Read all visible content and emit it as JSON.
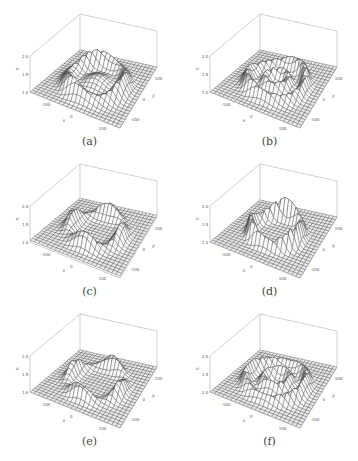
{
  "figure": {
    "panels": [
      {
        "id": "a",
        "caption": "(a)",
        "pattern": "ring-inner-dome",
        "col": 0,
        "row": 0
      },
      {
        "id": "b",
        "caption": "(b)",
        "pattern": "ring-double",
        "col": 1,
        "row": 0
      },
      {
        "id": "c",
        "caption": "(c)",
        "pattern": "ring-lumpy",
        "col": 0,
        "row": 1
      },
      {
        "id": "d",
        "caption": "(d)",
        "pattern": "ring-sharp",
        "col": 1,
        "row": 1
      },
      {
        "id": "e",
        "caption": "(e)",
        "pattern": "ring-lumpy-2",
        "col": 0,
        "row": 2
      },
      {
        "id": "f",
        "caption": "(f)",
        "pattern": "ring-double-2",
        "col": 1,
        "row": 2
      }
    ],
    "axes": {
      "z_label": "u",
      "z_ticks": [
        "1.0",
        "1.5",
        "2.0"
      ],
      "x_label": "x",
      "x_ticks": [
        "-100",
        "0",
        "100"
      ],
      "y_label": "y",
      "y_ticks": [
        "-100",
        "0",
        "100"
      ]
    }
  },
  "chart_data": [
    {
      "type": "surface",
      "title": "(a)",
      "xlabel": "x",
      "ylabel": "y",
      "zlabel": "u",
      "xlim": [
        -150,
        150
      ],
      "ylim": [
        -150,
        150
      ],
      "zlim": [
        1.0,
        2.0
      ],
      "description": "ring-shaped elevated region with central dome, uneven ring heights"
    },
    {
      "type": "surface",
      "title": "(b)",
      "xlabel": "x",
      "ylabel": "y",
      "zlabel": "u",
      "xlim": [
        -150,
        150
      ],
      "ylim": [
        -150,
        150
      ],
      "zlim": [
        1.0,
        2.0
      ],
      "description": "concentric double ring pattern"
    },
    {
      "type": "surface",
      "title": "(c)",
      "xlabel": "x",
      "ylabel": "y",
      "zlabel": "u",
      "xlim": [
        -150,
        150
      ],
      "ylim": [
        -150,
        150
      ],
      "zlim": [
        1.0,
        2.0
      ],
      "description": "ring with localized peaks, flat interior"
    },
    {
      "type": "surface",
      "title": "(d)",
      "xlabel": "x",
      "ylabel": "y",
      "zlabel": "u",
      "xlim": [
        -150,
        150
      ],
      "ylim": [
        -150,
        150
      ],
      "zlim": [
        1.0,
        2.0
      ],
      "description": "sharp ring with steep walls around flat depression"
    },
    {
      "type": "surface",
      "title": "(e)",
      "xlabel": "x",
      "ylabel": "y",
      "zlabel": "u",
      "xlim": [
        -150,
        150
      ],
      "ylim": [
        -150,
        150
      ],
      "zlim": [
        1.0,
        2.0
      ],
      "description": "ring with four localized peaks"
    },
    {
      "type": "surface",
      "title": "(f)",
      "xlabel": "x",
      "ylabel": "y",
      "zlabel": "u",
      "xlim": [
        -150,
        150
      ],
      "ylim": [
        -150,
        150
      ],
      "zlim": [
        1.0,
        2.0
      ],
      "description": "double ring with inner dome"
    }
  ]
}
